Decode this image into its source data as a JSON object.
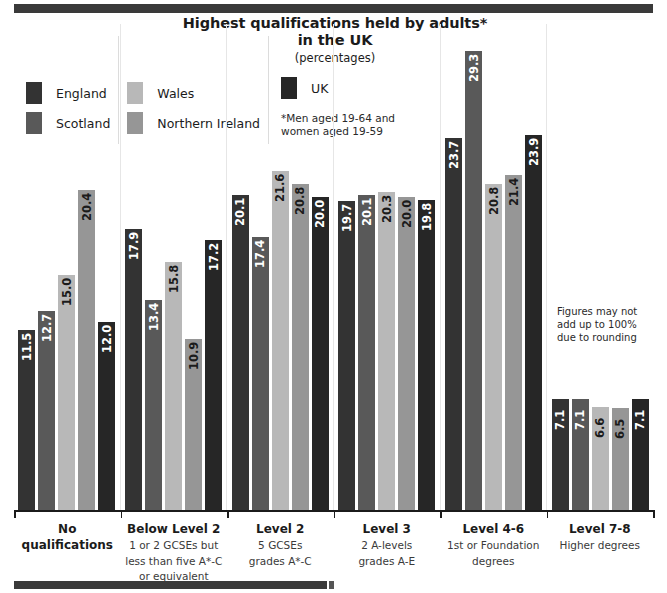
{
  "title": {
    "line1": "Highest qualifications held by adults*",
    "line2": "in the UK",
    "sub": "(percentages)"
  },
  "legend": {
    "items": [
      {
        "label": "England",
        "color": "#333333"
      },
      {
        "label": "Scotland",
        "color": "#595959"
      },
      {
        "label": "Wales",
        "color": "#b8b8b8"
      },
      {
        "label": "Northern Ireland",
        "color": "#969696"
      },
      {
        "label": "UK",
        "color": "#262626"
      }
    ],
    "footnote_line1": "*Men aged 19-64 and",
    "footnote_line2": "women aged 19-59"
  },
  "notes": {
    "rounding_line1": "Figures may not",
    "rounding_line2": "add up to 100%",
    "rounding_line3": "due to rounding"
  },
  "chart_data": {
    "type": "bar",
    "title": "Highest qualifications held by adults* in the UK (percentages)",
    "xlabel": "",
    "ylabel": "percentages",
    "ylim": [
      0,
      31
    ],
    "grid": false,
    "legend_position": "top-left",
    "categories": [
      "No qualifications",
      "Below Level 2",
      "Level 2",
      "Level 3",
      "Level 4-6",
      "Level 7-8"
    ],
    "category_sublabels": [
      [],
      [
        "1 or 2 GCSEs but",
        "less than five A*-C",
        "or equivalent"
      ],
      [
        "5 GCSEs",
        "grades A*-C"
      ],
      [
        "2 A-levels",
        "grades A-E"
      ],
      [
        "1st or Foundation",
        "degrees"
      ],
      [
        "Higher degrees"
      ]
    ],
    "series": [
      {
        "name": "England",
        "color": "#333333",
        "values": [
          11.5,
          17.9,
          20.1,
          19.7,
          23.7,
          7.1
        ]
      },
      {
        "name": "Scotland",
        "color": "#595959",
        "values": [
          12.7,
          13.4,
          17.4,
          20.1,
          29.3,
          7.1
        ]
      },
      {
        "name": "Wales",
        "color": "#b8b8b8",
        "values": [
          15.0,
          15.8,
          21.6,
          20.3,
          20.8,
          6.6
        ]
      },
      {
        "name": "Northern Ireland",
        "color": "#969696",
        "values": [
          20.4,
          10.9,
          20.8,
          20.0,
          21.4,
          6.5
        ]
      },
      {
        "name": "UK",
        "color": "#262626",
        "values": [
          12.0,
          17.2,
          20.0,
          19.8,
          23.9,
          7.1
        ]
      }
    ]
  }
}
